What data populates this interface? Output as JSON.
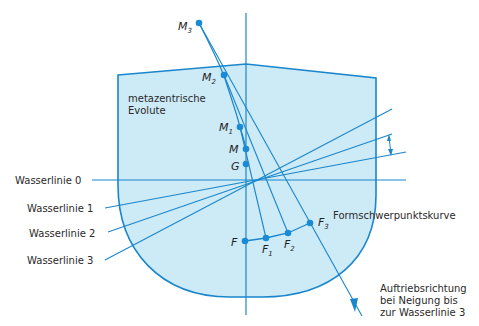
{
  "colors": {
    "hull_fill": "#cdeaf7",
    "line": "#1a86cc",
    "point": "#1a8ad4",
    "text": "#2a2a2a",
    "background": "#ffffff"
  },
  "labels": {
    "evolute_line1": "metazentrische",
    "evolute_line2": "Evolute",
    "waterline_0": "Wasserlinie 0",
    "waterline_1": "Wasserlinie 1",
    "waterline_2": "Wasserlinie 2",
    "waterline_3": "Wasserlinie 3",
    "form_curve": "Formschwerpunktskurve",
    "buoyancy_line1": "Auftriebsrichtung",
    "buoyancy_line2": "bei Neigung bis",
    "buoyancy_line3": "zur Wasserlinie 3"
  },
  "points": {
    "M3": {
      "label": "M",
      "sub": "3"
    },
    "M2": {
      "label": "M",
      "sub": "2"
    },
    "M1": {
      "label": "M",
      "sub": "1"
    },
    "M": {
      "label": "M",
      "sub": ""
    },
    "G": {
      "label": "G",
      "sub": ""
    },
    "F": {
      "label": "F",
      "sub": ""
    },
    "F1": {
      "label": "F",
      "sub": "1"
    },
    "F2": {
      "label": "F",
      "sub": "2"
    },
    "F3": {
      "label": "F",
      "sub": "3"
    }
  }
}
